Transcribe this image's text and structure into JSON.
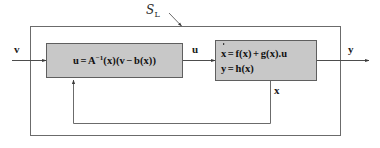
{
  "figure": {
    "type": "block-diagram",
    "background_color": "#ffffff",
    "line_color": "#4d4d4d",
    "block_fill": "#c8c8c8",
    "block_border": "#555555",
    "text_color": "#111111"
  },
  "system_boundary": {
    "label_symbol": "S",
    "label_subscript": "L",
    "name": "system-boundary-label"
  },
  "blocks": [
    {
      "id": "controller",
      "name": "controller-block",
      "equations": [
        {
          "lhs": "u",
          "relation": "=",
          "rhs": "A−1(x)(v − b(x))",
          "parts": {
            "u": "u",
            "eq": "=",
            "A": "A",
            "inv": "−1",
            "x1": "(x)",
            "open": "(",
            "v": "v",
            "minus": "−",
            "b": "b",
            "x2": "(x)",
            "close": ")"
          }
        }
      ]
    },
    {
      "id": "plant",
      "name": "plant-block",
      "equations": [
        {
          "lhs": "ẋ",
          "relation": "=",
          "rhs": "f(x) + g(x).u",
          "parts": {
            "xdot": "x",
            "eq": "=",
            "f": "f(x)",
            "plus": "+",
            "g": "g(x)",
            "dot": ".",
            "u": "u"
          }
        },
        {
          "lhs": "y",
          "relation": "=",
          "rhs": "h(x)",
          "parts": {
            "y": "y",
            "eq": "=",
            "h": "h(x)"
          }
        }
      ]
    }
  ],
  "signals": [
    {
      "id": "v",
      "label": "v",
      "name": "signal-label-v",
      "role": "external-input"
    },
    {
      "id": "u",
      "label": "u",
      "name": "signal-label-u",
      "role": "control-input"
    },
    {
      "id": "y",
      "label": "y",
      "name": "signal-label-y",
      "role": "output"
    },
    {
      "id": "x",
      "label": "x",
      "name": "signal-label-x",
      "role": "state-feedback"
    }
  ]
}
